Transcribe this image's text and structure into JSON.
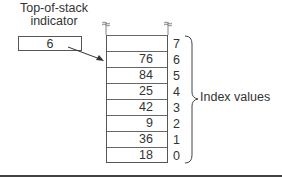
{
  "diagram": {
    "indicator": {
      "title_line1": "Top-of-stack",
      "title_line2": "indicator",
      "value": "6"
    },
    "stack": {
      "cells": [
        {
          "index": "7",
          "value": ""
        },
        {
          "index": "6",
          "value": "76"
        },
        {
          "index": "5",
          "value": "84"
        },
        {
          "index": "4",
          "value": "25"
        },
        {
          "index": "3",
          "value": "42"
        },
        {
          "index": "2",
          "value": "9"
        },
        {
          "index": "1",
          "value": "36"
        },
        {
          "index": "0",
          "value": "18"
        }
      ]
    },
    "brace_label": "Index values",
    "colors": {
      "line": "#555555",
      "text": "#333333",
      "background": "#ffffff"
    }
  }
}
